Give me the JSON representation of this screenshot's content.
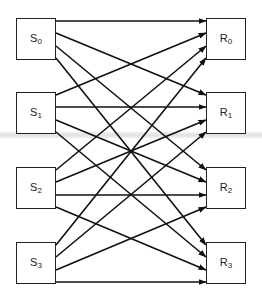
{
  "diagram": {
    "type": "bipartite-interconnection",
    "senders": [
      {
        "id": "S0",
        "base": "S",
        "sub": "0"
      },
      {
        "id": "S1",
        "base": "S",
        "sub": "1"
      },
      {
        "id": "S2",
        "base": "S",
        "sub": "2"
      },
      {
        "id": "S3",
        "base": "S",
        "sub": "3"
      }
    ],
    "receivers": [
      {
        "id": "R0",
        "base": "R",
        "sub": "0"
      },
      {
        "id": "R1",
        "base": "R",
        "sub": "1"
      },
      {
        "id": "R2",
        "base": "R",
        "sub": "2"
      },
      {
        "id": "R3",
        "base": "R",
        "sub": "3"
      }
    ],
    "edges": [
      [
        "S0",
        "R0"
      ],
      [
        "S0",
        "R1"
      ],
      [
        "S0",
        "R2"
      ],
      [
        "S0",
        "R3"
      ],
      [
        "S1",
        "R0"
      ],
      [
        "S1",
        "R1"
      ],
      [
        "S1",
        "R2"
      ],
      [
        "S1",
        "R3"
      ],
      [
        "S2",
        "R0"
      ],
      [
        "S2",
        "R1"
      ],
      [
        "S2",
        "R2"
      ],
      [
        "S2",
        "R3"
      ],
      [
        "S3",
        "R0"
      ],
      [
        "S3",
        "R1"
      ],
      [
        "S3",
        "R2"
      ],
      [
        "S3",
        "R3"
      ]
    ],
    "edge_style": "directed-arrow",
    "line_color": "#111111"
  }
}
